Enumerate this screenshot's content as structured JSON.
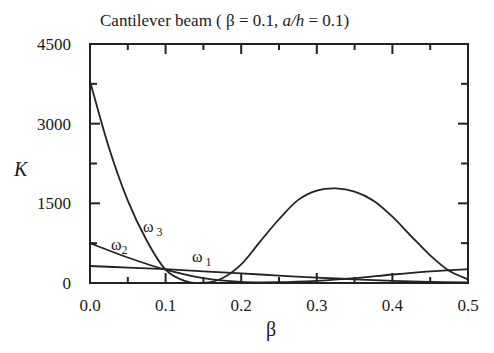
{
  "chart_data": {
    "type": "line",
    "title": "Cantilever beam (  β = 0.1,  a/h = 0.1)",
    "title_parts": {
      "prefix": "Cantilever beam (  β = 0.1,  ",
      "italic": "a/h",
      "suffix": " = 0.1)"
    },
    "xlabel": "β",
    "ylabel": "K",
    "xlim": [
      0.0,
      0.5
    ],
    "ylim": [
      0,
      4500
    ],
    "xticks": [
      0.0,
      0.1,
      0.2,
      0.3,
      0.4,
      0.5
    ],
    "xtick_labels": [
      "0.0",
      "0.1",
      "0.2",
      "0.3",
      "0.4",
      "0.5"
    ],
    "x_minor_ticks": [
      0.05,
      0.15,
      0.25,
      0.35,
      0.45
    ],
    "yticks": [
      0,
      1500,
      3000,
      4500
    ],
    "ytick_labels": [
      "0",
      "1500",
      "3000",
      "4500"
    ],
    "y_minor_ticks": [
      750,
      2250,
      3750
    ],
    "grid": false,
    "legend": "none (inline curve labels)",
    "series": [
      {
        "name": "ω1",
        "label_main": "ω",
        "label_sub": "1",
        "x": [
          0.0,
          0.05,
          0.1,
          0.15,
          0.2,
          0.25,
          0.3,
          0.35,
          0.4,
          0.45,
          0.5
        ],
        "y": [
          320,
          290,
          260,
          220,
          180,
          140,
          100,
          70,
          40,
          20,
          10
        ]
      },
      {
        "name": "ω2",
        "label_main": "ω",
        "label_sub": "2",
        "x": [
          0.0,
          0.05,
          0.1,
          0.15,
          0.2,
          0.25,
          0.3,
          0.35,
          0.4,
          0.45,
          0.5
        ],
        "y": [
          750,
          480,
          250,
          90,
          20,
          15,
          40,
          90,
          160,
          220,
          260
        ]
      },
      {
        "name": "ω3",
        "label_main": "ω",
        "label_sub": "3",
        "x": [
          0.0,
          0.025,
          0.05,
          0.075,
          0.1,
          0.125,
          0.15,
          0.175,
          0.2,
          0.225,
          0.25,
          0.275,
          0.3,
          0.325,
          0.35,
          0.375,
          0.4,
          0.425,
          0.45,
          0.475,
          0.5
        ],
        "y": [
          3800,
          2550,
          1550,
          800,
          250,
          40,
          0,
          90,
          350,
          780,
          1200,
          1560,
          1740,
          1780,
          1720,
          1550,
          1250,
          880,
          520,
          230,
          70
        ]
      }
    ]
  }
}
